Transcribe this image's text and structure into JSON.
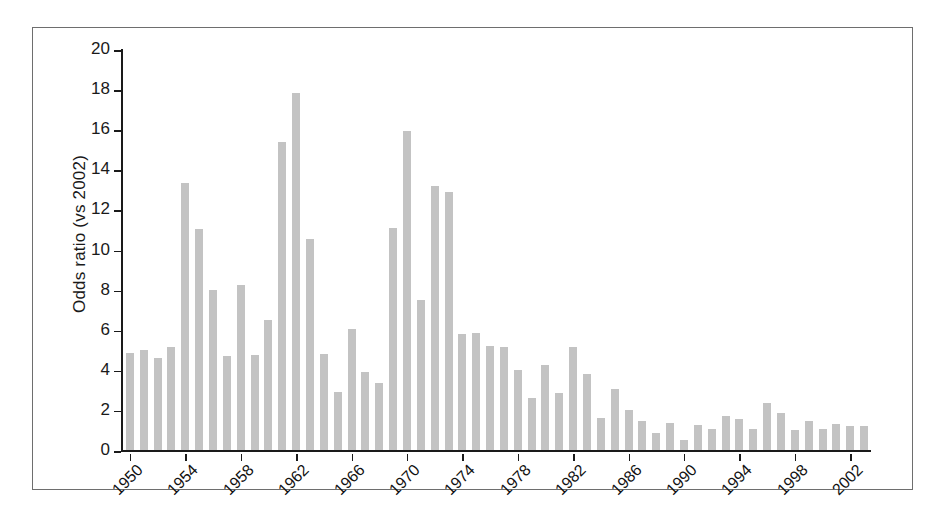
{
  "figure": {
    "has_frame": true,
    "background": "#ffffff",
    "bar_color": "#c3c3c3",
    "axis_color": "#1a1a1a"
  },
  "chart_data": {
    "type": "bar",
    "title": "",
    "xlabel": "",
    "ylabel": "Odds ratio (vs 2002)",
    "ylim": [
      0,
      20
    ],
    "yticks": [
      0,
      2,
      4,
      6,
      8,
      10,
      12,
      14,
      16,
      18,
      20
    ],
    "grid": false,
    "legend": null,
    "xtick_labels": [
      "1950",
      "1954",
      "1958",
      "1962",
      "1966",
      "1970",
      "1974",
      "1978",
      "1982",
      "1986",
      "1990",
      "1994",
      "1998",
      "2002"
    ],
    "xtick_step": 4,
    "categories": [
      "1950",
      "1951",
      "1952",
      "1953",
      "1954",
      "1955",
      "1956",
      "1957",
      "1958",
      "1959",
      "1960",
      "1961",
      "1962",
      "1963",
      "1964",
      "1965",
      "1966",
      "1967",
      "1968",
      "1969",
      "1970",
      "1971",
      "1972",
      "1973",
      "1974",
      "1975",
      "1976",
      "1977",
      "1978",
      "1979",
      "1980",
      "1981",
      "1982",
      "1983",
      "1984",
      "1985",
      "1986",
      "1987",
      "1988",
      "1989",
      "1990",
      "1991",
      "1992",
      "1993",
      "1994",
      "1995",
      "1996",
      "1997",
      "1998",
      "1999",
      "2000",
      "2001",
      "2002",
      "2003"
    ],
    "values": [
      4.85,
      5.0,
      4.6,
      5.15,
      13.3,
      11.0,
      8.0,
      4.7,
      8.25,
      4.75,
      6.5,
      15.35,
      17.8,
      10.5,
      4.8,
      2.9,
      6.05,
      3.9,
      3.35,
      11.05,
      15.9,
      7.5,
      13.15,
      12.85,
      5.8,
      5.85,
      5.2,
      5.15,
      4.0,
      2.6,
      4.25,
      2.85,
      5.15,
      3.8,
      1.6,
      3.05,
      2.0,
      1.45,
      0.85,
      1.35,
      0.5,
      1.25,
      1.05,
      1.7,
      1.55,
      1.05,
      2.35,
      1.85,
      1.0,
      1.45,
      1.05,
      1.3,
      1.2,
      1.2
    ]
  }
}
